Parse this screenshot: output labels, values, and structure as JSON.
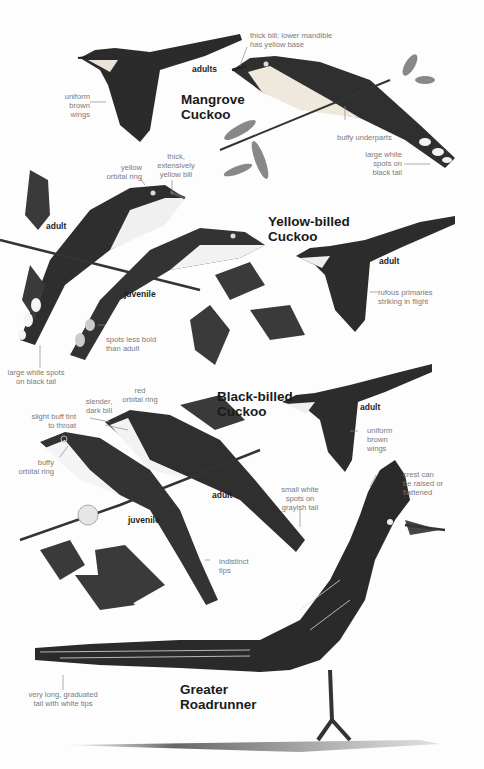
{
  "species": [
    {
      "id": "mangrove",
      "name_line1": "Mangrove",
      "name_line2": "Cuckoo"
    },
    {
      "id": "yellow-billed",
      "name_line1": "Yellow-billed",
      "name_line2": "Cuckoo"
    },
    {
      "id": "black-billed",
      "name_line1": "Black-billed",
      "name_line2": "Cuckoo"
    },
    {
      "id": "roadrunner",
      "name_line1": "Greater",
      "name_line2": "Roadrunner"
    }
  ],
  "age_labels": {
    "mangrove_adults": "adults",
    "yellow_billed_adult_perched": "adult",
    "yellow_billed_juvenile": "juvenile",
    "yellow_billed_adult_flight": "adult",
    "black_billed_adult_flight": "adult",
    "black_billed_adult_perched": "adult",
    "black_billed_juvenile": "juvenile"
  },
  "annotations": {
    "mangrove_wings": [
      "uniform",
      "brown",
      "wings"
    ],
    "mangrove_bill": [
      "thick bill; lower mandible",
      "has yellow base"
    ],
    "mangrove_underparts": [
      "buffy underparts"
    ],
    "mangrove_tail": [
      "large white",
      "spots on",
      "black tail"
    ],
    "yb_orbital": [
      "yellow",
      "orbital ring"
    ],
    "yb_bill": [
      "thick,",
      "extensively",
      "yellow bill"
    ],
    "yb_primaries": [
      "rufous primaries",
      "striking in flight"
    ],
    "yb_juv_spots": [
      "spots less bold",
      "than adult"
    ],
    "yb_tail": [
      "large white spots",
      "on black tail"
    ],
    "bb_bill": [
      "slender,",
      "dark bill"
    ],
    "bb_orbital_red": [
      "red",
      "orbital ring"
    ],
    "bb_throat": [
      "slight buff tint",
      "to throat"
    ],
    "bb_orbital_buffy": [
      "buffy",
      "orbital ring"
    ],
    "bb_wings": [
      "uniform",
      "brown",
      "wings"
    ],
    "bb_tail": [
      "small white",
      "spots on",
      "grayish tail"
    ],
    "bb_juv_tips": [
      "indistinct",
      "tips"
    ],
    "rr_crest": [
      "crest can",
      "be raised or",
      "flattened"
    ],
    "rr_tail": [
      "very long, graduated",
      "tail with white tips"
    ]
  }
}
